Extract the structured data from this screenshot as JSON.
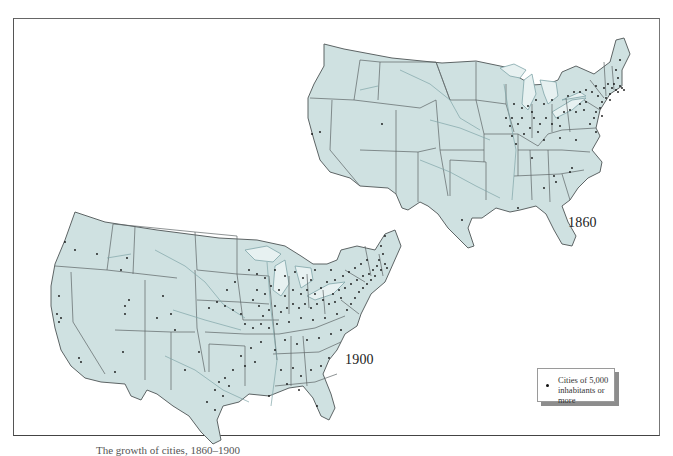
{
  "figure": {
    "maps": [
      {
        "id": "map-1860",
        "year_label": "1860"
      },
      {
        "id": "map-1900",
        "year_label": "1900"
      }
    ],
    "legend": {
      "symbol": "dot",
      "text_line1": "Cities of 5,000",
      "text_line2": "inhabitants or more"
    },
    "caption": "The growth of cities, 1860–1900",
    "colors": {
      "land_fill": "#cfe1e1",
      "state_border": "#5d6465",
      "river": "#7fa5a8",
      "city_dot": "#111111",
      "frame": "#555555"
    }
  }
}
